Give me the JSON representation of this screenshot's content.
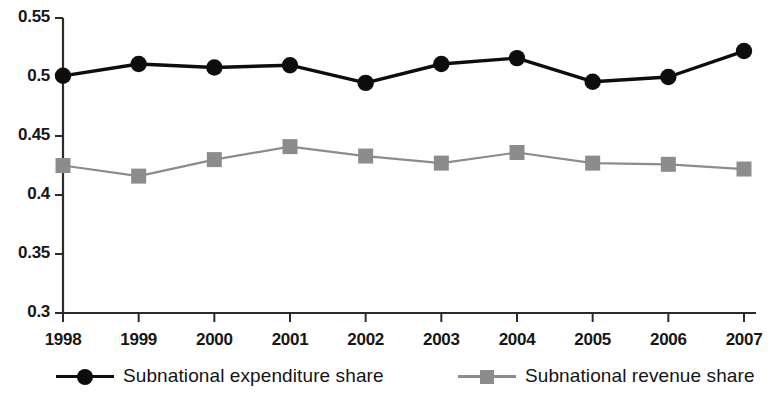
{
  "chart_data": {
    "type": "line",
    "title": "",
    "subtitle": "",
    "xlabel": "",
    "ylabel": "",
    "categories": [
      "1998",
      "1999",
      "2000",
      "2001",
      "2002",
      "2003",
      "2004",
      "2005",
      "2006",
      "2007"
    ],
    "x": [
      1998,
      1999,
      2000,
      2001,
      2002,
      2003,
      2004,
      2005,
      2006,
      2007
    ],
    "ylim": [
      0.3,
      0.55
    ],
    "yticks": [
      0.3,
      0.35,
      0.4,
      0.45,
      0.5,
      0.55
    ],
    "ytick_labels": [
      "0.3",
      "0.35",
      "0.4",
      "0.45",
      "0.5",
      "0.55"
    ],
    "xtick_labels": [
      "1998",
      "1999",
      "2000",
      "2001",
      "2002",
      "2003",
      "2004",
      "2005",
      "2006",
      "2007"
    ],
    "grid": false,
    "legend_position": "bottom",
    "series": [
      {
        "name": "Subnational expenditure share",
        "color": "#0d0d0d",
        "marker": "circle",
        "values": [
          0.501,
          0.511,
          0.508,
          0.51,
          0.495,
          0.511,
          0.516,
          0.496,
          0.5,
          0.522
        ]
      },
      {
        "name": "Subnational revenue share",
        "color": "#8c8c8c",
        "marker": "square",
        "values": [
          0.425,
          0.416,
          0.43,
          0.441,
          0.433,
          0.427,
          0.436,
          0.427,
          0.426,
          0.422
        ]
      }
    ]
  },
  "legend": {
    "entries": [
      {
        "label": "Subnational expenditure share",
        "marker": "circle-marker-icon"
      },
      {
        "label": "Subnational revenue share",
        "marker": "square-marker-icon"
      }
    ]
  },
  "colors": {
    "axis": "#2b2b2b",
    "expenditure": "#0d0d0d",
    "revenue": "#8c8c8c",
    "background": "#ffffff",
    "text": "#171717"
  }
}
